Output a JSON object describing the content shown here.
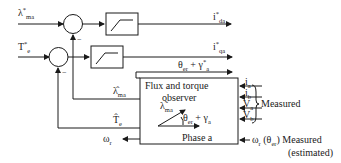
{
  "diagram": {
    "inputs": {
      "flux_ref": {
        "sym": "λ",
        "sup": "*",
        "sub": "ma"
      },
      "torque_ref": {
        "sym": "T",
        "sup": "*",
        "sub": "e"
      }
    },
    "outputs": {
      "id_ref": {
        "sym": "i",
        "sup": "*",
        "sub": "da"
      },
      "iq_ref": {
        "sym": "i",
        "sup": "*",
        "sub": "qa"
      },
      "angle": {
        "sym": "θ",
        "sub": "er",
        "plus": " + γ",
        "sup2": "*",
        "sub2": "a"
      }
    },
    "observer": {
      "title_line1": "Flux and torque",
      "title_line2": "observer",
      "vector_label": {
        "sym": "λ̃",
        "sub": "ma"
      },
      "angle_label": {
        "sym": "θ",
        "sub": "er",
        "plus": " + γ",
        "sub2": "a"
      },
      "phase_label": "Phase a"
    },
    "feedback": {
      "flux_est": {
        "sym": "λ̂",
        "sub": "ma"
      },
      "torque_est": {
        "sym": "T̂",
        "sub": "e"
      },
      "speed": {
        "sym": "ω",
        "sub": "r"
      }
    },
    "measured_inputs": [
      {
        "sym": "i",
        "sub": "a"
      },
      {
        "sym": "i",
        "sub": "b"
      },
      {
        "sym": "V",
        "sub": "a"
      },
      {
        "sym": "V",
        "sub": "b"
      }
    ],
    "measured_label": "Measured",
    "speed_input": {
      "sym": "ω",
      "sub": "r",
      "paren": "(θ",
      "paren_sub": "er",
      "paren_end": ")",
      "label": "Measured",
      "label2": "(estimated)"
    },
    "summer_signs": [
      "−",
      "−"
    ]
  }
}
